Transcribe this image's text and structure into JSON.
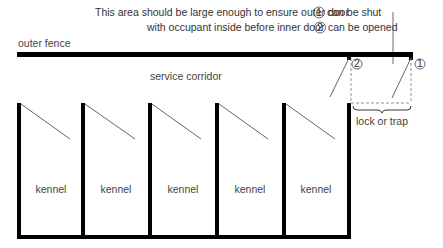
{
  "annotation": {
    "line1_text": "This area should be large enough  to ensure outer door",
    "line1_marker": "1",
    "line1_end": "can be shut",
    "line2_text": "with occupant inside before inner door",
    "line2_marker": "2",
    "line2_end": "can be opened"
  },
  "labels": {
    "outer_fence": "outer fence",
    "service_corridor": "service corridor",
    "lock_or_trap": "lock or trap",
    "door_inner_marker": "2",
    "door_outer_marker": "1"
  },
  "kennels": [
    {
      "label": "kennel"
    },
    {
      "label": "kennel"
    },
    {
      "label": "kennel"
    },
    {
      "label": "kennel"
    },
    {
      "label": "kennel"
    }
  ],
  "colors": {
    "wall": "#000000",
    "door_line": "#555555",
    "dashed": "#777777",
    "text": "#333333"
  }
}
